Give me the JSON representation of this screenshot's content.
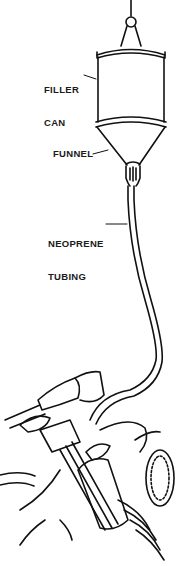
{
  "diagram": {
    "type": "technical-illustration",
    "line_color": "#111111",
    "background": "#ffffff",
    "labels": [
      {
        "id": "filler-can",
        "text": "FILLER\nCAN",
        "line1": "FILLER",
        "line2": "CAN"
      },
      {
        "id": "funnel",
        "text": "FUNNEL"
      },
      {
        "id": "neoprene-tubing",
        "text": "NEOPRENE\nTUBING",
        "line1": "NEOPRENE",
        "line2": "TUBING"
      }
    ],
    "components": [
      "hook",
      "filler-can",
      "funnel",
      "nozzle",
      "neoprene-tubing",
      "motorcycle-front-fork",
      "handlebar",
      "headlight"
    ]
  }
}
